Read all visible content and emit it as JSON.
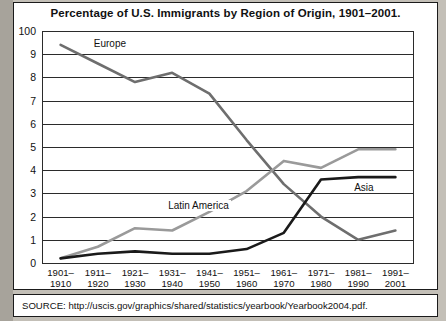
{
  "figure": {
    "title": "Percentage of U.S. Immigrants by Region of Origin, 1901–2001.",
    "source": "SOURCE: http://uscis.gov/graphics/shared/statistics/yearbook/Yearbook2004.pdf."
  },
  "chart_data": {
    "type": "line",
    "title": "Percentage of U.S. Immigrants by Region of Origin, 1901–2001.",
    "xlabel": "",
    "ylabel": "",
    "grid": true,
    "legend": "inline-labels",
    "ylim": [
      0,
      10
    ],
    "ytick_labels": [
      "100",
      "9",
      "8",
      "7",
      "6",
      "5",
      "4",
      "3",
      "2",
      "1",
      "0"
    ],
    "ytick_values": [
      10,
      9,
      8,
      7,
      6,
      5,
      4,
      3,
      2,
      1,
      0
    ],
    "categories": [
      "1901–1910",
      "1911–1920",
      "1921–1930",
      "1931–1940",
      "1941–1950",
      "1951–1960",
      "1961–1970",
      "1971–1980",
      "1981–1990",
      "1991–2001"
    ],
    "categories_lines": [
      [
        "1901–",
        "1910"
      ],
      [
        "1911–",
        "1920"
      ],
      [
        "1921–",
        "1930"
      ],
      [
        "1931–",
        "1940"
      ],
      [
        "1941–",
        "1950"
      ],
      [
        "1951–",
        "1960"
      ],
      [
        "1961–",
        "1970"
      ],
      [
        "1971–",
        "1980"
      ],
      [
        "1981–",
        "1990"
      ],
      [
        "1991–",
        "2001"
      ]
    ],
    "series": [
      {
        "name": "Europe",
        "color": "#6e6e6e",
        "values": [
          9.4,
          8.6,
          7.8,
          8.2,
          7.3,
          5.3,
          3.4,
          2.0,
          1.0,
          1.4
        ],
        "label_x_index": 1,
        "label_y": 9.45
      },
      {
        "name": "Latin America",
        "color": "#9a9a9a",
        "values": [
          0.2,
          0.7,
          1.5,
          1.4,
          2.2,
          3.1,
          4.4,
          4.1,
          4.9,
          4.9
        ],
        "label_x_index": 3,
        "label_y": 2.45
      },
      {
        "name": "Asia",
        "color": "#1a1a1a",
        "values": [
          0.2,
          0.4,
          0.5,
          0.4,
          0.4,
          0.6,
          1.3,
          3.6,
          3.7,
          3.7
        ],
        "label_x_index": 8,
        "label_y": 3.25
      }
    ]
  }
}
